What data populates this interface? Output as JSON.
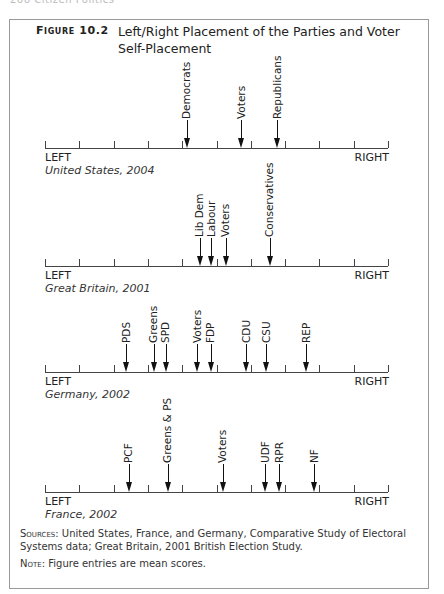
{
  "running_head": "266 Citizen Politics",
  "figure": {
    "label": "Figure 10.2",
    "title": "Left/Right Placement of the Parties and Voter Self-Placement"
  },
  "axis_labels": {
    "left": "LEFT",
    "right": "RIGHT"
  },
  "notes": {
    "sources_label": "Sources:",
    "sources_text": "United States, France, and Germany, Comparative Study of Electoral Systems data; Great Britain, 2001 British Election Study.",
    "note_label": "Note:",
    "note_text": "Figure entries are mean scores."
  },
  "chart_data": {
    "type": "scatter",
    "title": "Left/Right Placement of the Parties and Voter Self-Placement",
    "xlabel": "Left/Right scale (LEFT to RIGHT)",
    "xlim": [
      0,
      10
    ],
    "ticks": [
      0,
      1,
      2,
      3,
      4,
      5,
      6,
      7,
      8,
      9,
      10
    ],
    "grid": false,
    "panels": [
      {
        "caption": "United States, 2004",
        "axis_y": 148,
        "points": [
          {
            "name": "Democrats",
            "value": 4.14
          },
          {
            "name": "Voters",
            "value": 5.74
          },
          {
            "name": "Republicans",
            "value": 6.79
          }
        ]
      },
      {
        "caption": "Great Britain, 2001",
        "axis_y": 266,
        "points": [
          {
            "name": "Lib Dem",
            "value": 4.52
          },
          {
            "name": "Labour",
            "value": 4.86
          },
          {
            "name": "Voters",
            "value": 5.28
          },
          {
            "name": "Conservatives",
            "value": 6.56
          }
        ]
      },
      {
        "caption": "Germany, 2002",
        "axis_y": 372,
        "points": [
          {
            "name": "PDS",
            "value": 2.38
          },
          {
            "name": "Greens",
            "value": 3.18
          },
          {
            "name": "SPD",
            "value": 3.53
          },
          {
            "name": "Voters",
            "value": 4.46
          },
          {
            "name": "FDP",
            "value": 4.84
          },
          {
            "name": "CDU",
            "value": 5.88
          },
          {
            "name": "CSU",
            "value": 6.46
          },
          {
            "name": "REP",
            "value": 7.63
          }
        ]
      },
      {
        "caption": "France, 2002",
        "axis_y": 492,
        "points": [
          {
            "name": "PCF",
            "value": 2.46
          },
          {
            "name": "Greens & PS",
            "value": 3.59
          },
          {
            "name": "Voters",
            "value": 5.19
          },
          {
            "name": "UDF",
            "value": 6.44
          },
          {
            "name": "RPR",
            "value": 6.85
          },
          {
            "name": "NF",
            "value": 7.87
          }
        ]
      }
    ]
  }
}
